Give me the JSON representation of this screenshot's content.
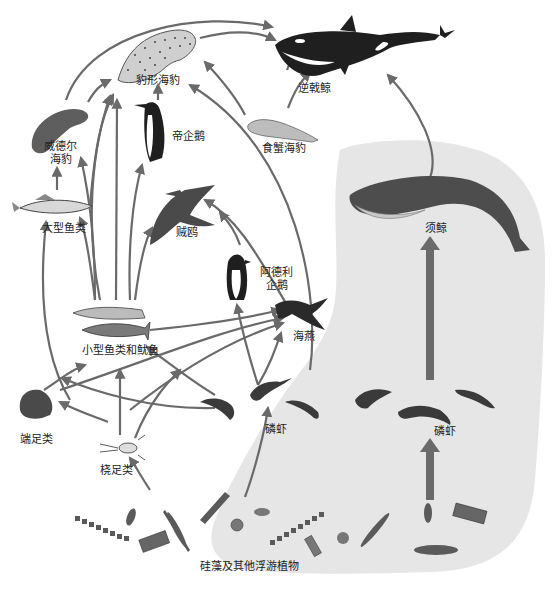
{
  "diagram": {
    "title": "",
    "type": "food-web",
    "colors": {
      "arrow": "#6a6a6a",
      "krill_region": "#e6e6e6",
      "organism_dark": "#2a2a2a",
      "organism_mid": "#6e6e6e",
      "organism_light": "#bdbdbd"
    },
    "nodes": [
      {
        "id": "orca",
        "label": "逆戟鲸"
      },
      {
        "id": "leopard_seal",
        "label": "豹形海豹"
      },
      {
        "id": "emperor_penguin",
        "label": "帝企鹅"
      },
      {
        "id": "weddell_seal",
        "label_line1": "威德尔",
        "label_line2": "海豹"
      },
      {
        "id": "crabeater_seal",
        "label": "食蟹海豹"
      },
      {
        "id": "large_fish",
        "label": "大型鱼类"
      },
      {
        "id": "skua",
        "label": "贼鸥"
      },
      {
        "id": "adelie_penguin",
        "label_line1": "阿德利",
        "label_line2": "企鹅"
      },
      {
        "id": "baleen_whale",
        "label": "须鲸"
      },
      {
        "id": "petrel",
        "label": "海燕"
      },
      {
        "id": "small_fish_squid",
        "label": "小型鱼类和鱿鱼"
      },
      {
        "id": "amphipods",
        "label": "端足类"
      },
      {
        "id": "copepods",
        "label": "桡足类"
      },
      {
        "id": "krill_left",
        "label": "磷虾"
      },
      {
        "id": "krill_right",
        "label": "磷虾"
      },
      {
        "id": "phytoplankton",
        "label": "硅藻及其他浮游植物"
      }
    ],
    "edges": [
      [
        "leopard_seal",
        "orca"
      ],
      [
        "weddell_seal",
        "orca"
      ],
      [
        "crabeater_seal",
        "orca"
      ],
      [
        "baleen_whale",
        "orca"
      ],
      [
        "weddell_seal",
        "leopard_seal"
      ],
      [
        "emperor_penguin",
        "leopard_seal"
      ],
      [
        "crabeater_seal",
        "leopard_seal"
      ],
      [
        "adelie_penguin",
        "leopard_seal"
      ],
      [
        "large_fish",
        "leopard_seal"
      ],
      [
        "small_fish_squid",
        "leopard_seal"
      ],
      [
        "large_fish",
        "weddell_seal"
      ],
      [
        "small_fish_squid",
        "weddell_seal"
      ],
      [
        "small_fish_squid",
        "emperor_penguin"
      ],
      [
        "small_fish_squid",
        "large_fish"
      ],
      [
        "small_fish_squid",
        "skua"
      ],
      [
        "adelie_penguin",
        "skua"
      ],
      [
        "petrel",
        "skua"
      ],
      [
        "small_fish_squid",
        "petrel"
      ],
      [
        "amphipods",
        "petrel"
      ],
      [
        "copepods",
        "petrel"
      ],
      [
        "krill_left",
        "petrel"
      ],
      [
        "krill_left",
        "adelie_penguin"
      ],
      [
        "krill_left",
        "crabeater_seal"
      ],
      [
        "krill_left",
        "small_fish_squid"
      ],
      [
        "amphipods",
        "small_fish_squid"
      ],
      [
        "copepods",
        "small_fish_squid"
      ],
      [
        "copepods",
        "amphipods"
      ],
      [
        "amphipods",
        "large_fish"
      ],
      [
        "phytoplankton",
        "copepods"
      ],
      [
        "phytoplankton",
        "krill_left"
      ],
      [
        "krill_right",
        "baleen_whale"
      ],
      [
        "phytoplankton",
        "krill_right"
      ]
    ]
  }
}
